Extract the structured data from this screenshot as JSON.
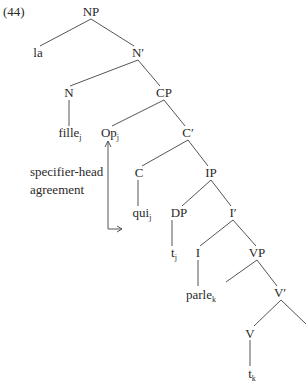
{
  "example_number": "(44)",
  "annotation": {
    "line1": "specifier-head",
    "line2": "agreement"
  },
  "nodes": {
    "np": {
      "label": "NP"
    },
    "la": {
      "label": "la"
    },
    "n_bar": {
      "label": "N′"
    },
    "n": {
      "label": "N"
    },
    "cp": {
      "label": "CP"
    },
    "fille": {
      "label": "fille",
      "sub": "j"
    },
    "op": {
      "label": "Op",
      "sub": "j"
    },
    "c_bar": {
      "label": "C′"
    },
    "c": {
      "label": "C"
    },
    "ip": {
      "label": "IP"
    },
    "qui": {
      "label": "qui",
      "sub": "j"
    },
    "dp": {
      "label": "DP"
    },
    "i_bar": {
      "label": "I′"
    },
    "t_j": {
      "label": "t",
      "sub": "j"
    },
    "i": {
      "label": "I"
    },
    "vp": {
      "label": "VP"
    },
    "parle": {
      "label": "parle",
      "sub": "k"
    },
    "v_bar": {
      "label": "V′"
    },
    "v": {
      "label": "V"
    },
    "t_k": {
      "label": "t",
      "sub": "k"
    }
  }
}
